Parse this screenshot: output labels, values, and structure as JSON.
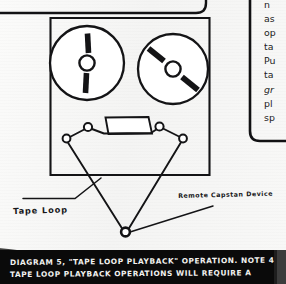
{
  "document": {
    "kind": "scanned-handwritten-technical-diagram",
    "background_color": "#f8f8f7",
    "ink_color": "#131315"
  },
  "diagram": {
    "title_label": "Diagram 5 Tape Loop Playback Operation",
    "deck": {
      "name": "tape deck body",
      "reels": [
        {
          "id": "supply-reel",
          "position": "left",
          "spoke_orientation": "vertical"
        },
        {
          "id": "takeup-reel",
          "position": "right",
          "spoke_orientation": "diagonal"
        }
      ],
      "head_assembly": "tape head block",
      "guide_rollers": 4
    },
    "tape_path": {
      "shape": "long V loop descending below deck",
      "apex_device": "remote capstan"
    }
  },
  "labels": {
    "tape_loop": "Tape Loop",
    "remote_capstan": "Remote Capstan Device"
  },
  "sidebar_text": {
    "note": "right-hand text column is clipped by the image edge; only leading character fragments are visible",
    "lines": [
      {
        "text": "n",
        "italic": false
      },
      {
        "text": "as",
        "italic": false
      },
      {
        "text": "op",
        "italic": false
      },
      {
        "text": "ta",
        "italic": false
      },
      {
        "text": "Pu",
        "italic": false
      },
      {
        "text": "ta",
        "italic": false
      },
      {
        "text": "gr",
        "italic": true
      },
      {
        "text": "pl",
        "italic": false
      },
      {
        "text": "sp",
        "italic": false
      }
    ]
  },
  "caption": {
    "line1": "DIAGRAM 5, \"TAPE LOOP PLAYBACK\" OPERATION. NOTE 4) MOST",
    "line2": "TAPE LOOP PLAYBACK OPERATIONS WILL REQUIRE A",
    "background_color": "#0a0a0a",
    "text_color": "#f2f2f0"
  }
}
